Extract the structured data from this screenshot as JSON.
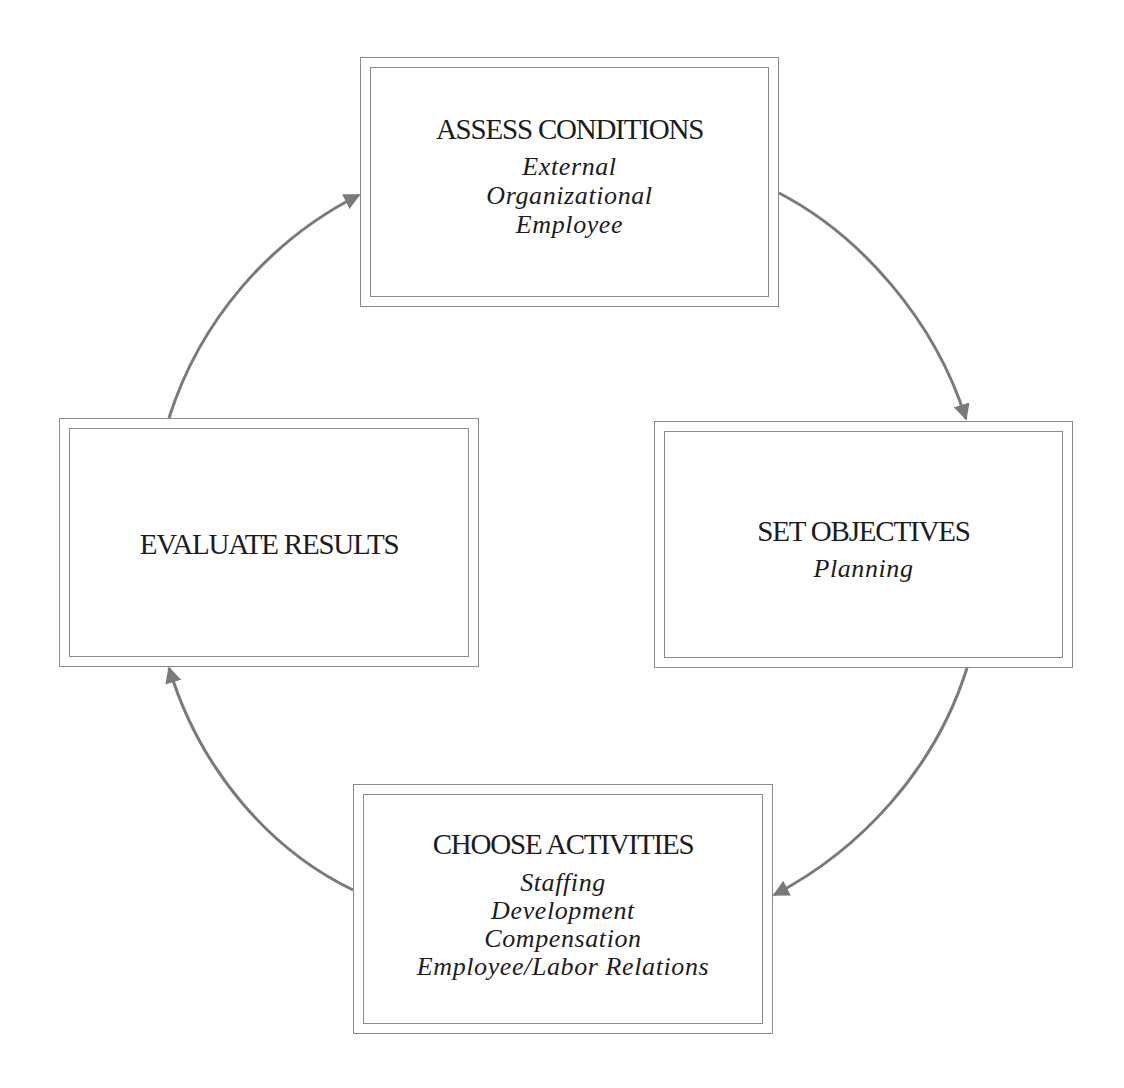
{
  "diagram": {
    "type": "cycle",
    "stroke_color": "#8a8a8a",
    "arrow_color": "#7a7a7a",
    "boxes": [
      {
        "id": "assess",
        "title": "ASSESS CONDITIONS",
        "items": [
          "External",
          "Organizational",
          "Employee"
        ]
      },
      {
        "id": "objectives",
        "title": "SET OBJECTIVES",
        "items": [
          "Planning"
        ]
      },
      {
        "id": "activities",
        "title": "CHOOSE ACTIVITIES",
        "items": [
          "Staffing",
          "Development",
          "Compensation",
          "Employee/Labor Relations"
        ]
      },
      {
        "id": "evaluate",
        "title": "EVALUATE RESULTS",
        "items": []
      }
    ],
    "arrows": [
      {
        "from": "ASSESS CONDITIONS",
        "to": "SET OBJECTIVES"
      },
      {
        "from": "SET OBJECTIVES",
        "to": "CHOOSE ACTIVITIES"
      },
      {
        "from": "CHOOSE ACTIVITIES",
        "to": "EVALUATE RESULTS"
      },
      {
        "from": "EVALUATE RESULTS",
        "to": "ASSESS CONDITIONS"
      }
    ]
  }
}
